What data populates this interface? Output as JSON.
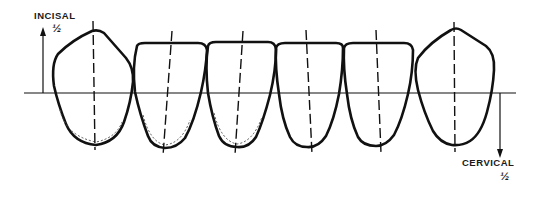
{
  "figure": {
    "type": "dental-diagram",
    "line_color": "#111111",
    "background": "#ffffff"
  },
  "labels": {
    "incisal": {
      "text": "INCISAL",
      "fraction": "½",
      "direction": "up"
    },
    "cervical": {
      "text": "CERVICAL",
      "fraction": "½",
      "direction": "down"
    }
  },
  "teeth": [
    {
      "name": "canine",
      "position": 1,
      "tip": "pointed"
    },
    {
      "name": "lateral-incisor",
      "position": 2,
      "tip": "flat"
    },
    {
      "name": "central-incisor",
      "position": 3,
      "tip": "flat"
    },
    {
      "name": "central-incisor",
      "position": 4,
      "tip": "flat"
    },
    {
      "name": "lateral-incisor",
      "position": 5,
      "tip": "flat"
    },
    {
      "name": "canine",
      "position": 6,
      "tip": "pointed"
    }
  ]
}
